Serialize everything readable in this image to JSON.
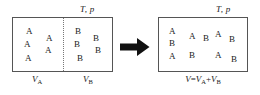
{
  "figure": {
    "type": "thermodynamic-mixing-diagram",
    "ink_color": "#1a1a1a",
    "border_color": "#555555",
    "partition_color": "#777777",
    "arrow_color": "#111111"
  },
  "before": {
    "state_label": "T, p",
    "left_compartment": {
      "volume_label_text": "V",
      "volume_label_sub": "A",
      "species": "A",
      "count": 5,
      "molecules": [
        {
          "label": "A",
          "x": 13,
          "y": 9
        },
        {
          "label": "A",
          "x": 33,
          "y": 16
        },
        {
          "label": "A",
          "x": 11,
          "y": 22
        },
        {
          "label": "A",
          "x": 32,
          "y": 28
        },
        {
          "label": "A",
          "x": 12,
          "y": 36
        }
      ]
    },
    "right_compartment": {
      "volume_label_text": "V",
      "volume_label_sub": "B",
      "species": "B",
      "count": 5,
      "molecules": [
        {
          "label": "B",
          "x": 62,
          "y": 9
        },
        {
          "label": "B",
          "x": 80,
          "y": 16
        },
        {
          "label": "B",
          "x": 61,
          "y": 22
        },
        {
          "label": "B",
          "x": 82,
          "y": 28
        },
        {
          "label": "B",
          "x": 64,
          "y": 36
        }
      ]
    },
    "partition": "dotted-removable-partition"
  },
  "arrow": {
    "glyph": "right-arrow",
    "direction": "right"
  },
  "after": {
    "state_label": "T, p",
    "volume_equation": {
      "lhs": "V",
      "operator": "=",
      "term1_text": "V",
      "term1_sub": "A",
      "plus": "+",
      "term2_text": "V",
      "term2_sub": "B",
      "full": "V = VA + VB"
    },
    "species": [
      "A",
      "B"
    ],
    "count_a": 5,
    "count_b": 5,
    "molecules": [
      {
        "label": "A",
        "x": 10,
        "y": 9
      },
      {
        "label": "A",
        "x": 30,
        "y": 14
      },
      {
        "label": "B",
        "x": 44,
        "y": 16
      },
      {
        "label": "A",
        "x": 56,
        "y": 12
      },
      {
        "label": "B",
        "x": 70,
        "y": 17
      },
      {
        "label": "B",
        "x": 10,
        "y": 21
      },
      {
        "label": "A",
        "x": 10,
        "y": 34
      },
      {
        "label": "B",
        "x": 30,
        "y": 33
      },
      {
        "label": "A",
        "x": 56,
        "y": 33
      },
      {
        "label": "B",
        "x": 72,
        "y": 37
      }
    ]
  }
}
